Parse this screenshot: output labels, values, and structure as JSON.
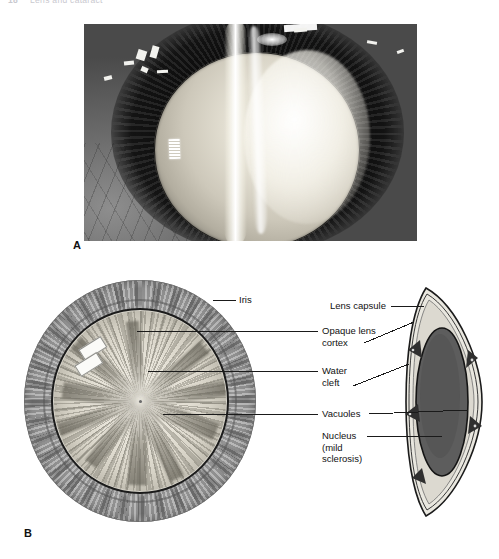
{
  "running_head": {
    "folio": "18",
    "title": "Lens and cataract"
  },
  "figure": {
    "panels": [
      {
        "letter": "A",
        "name": "slit-lamp-photograph",
        "description": "Slit-lamp photograph of eye with cortical cataract"
      },
      {
        "letter": "B",
        "name": "lens-diagram",
        "description": "Diagram of lens: en-face view and cross-section"
      }
    ]
  },
  "panel_a": {
    "letter": "A"
  },
  "panel_b": {
    "letter": "B",
    "labels": [
      {
        "id": "iris",
        "text": "Iris"
      },
      {
        "id": "lens-capsule",
        "text": "Lens capsule"
      },
      {
        "id": "opaque-lens-cortex",
        "text": "Opaque lens\ncortex"
      },
      {
        "id": "water-cleft",
        "text": "Water\ncleft"
      },
      {
        "id": "vacuoles",
        "text": "Vacuoles"
      },
      {
        "id": "nucleus",
        "text": "Nucleus\n(mild\nsclerosis)"
      }
    ]
  },
  "colors": {
    "page_background": "#ffffff",
    "ink": "#111111",
    "running_head": "#c9c9cf",
    "iris_gray": "#a9a9a9",
    "lens_cortex": "#e6e2d7",
    "nucleus_dark": "#585858",
    "capsule_line": "#1b1b1b",
    "vacuole_wedge": "#3a3a3a"
  }
}
